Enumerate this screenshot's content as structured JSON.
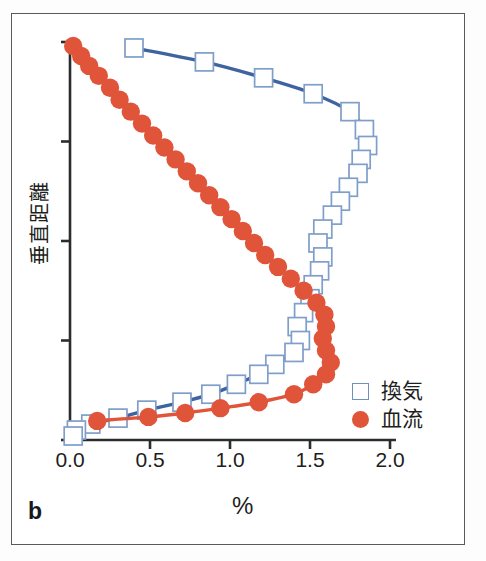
{
  "panel": {
    "label": "b"
  },
  "axes": {
    "x_title": "%",
    "y_title": "垂直距離",
    "x_ticks": [
      "0.0",
      "0.5",
      "1.0",
      "1.5",
      "2.0"
    ],
    "y_tick_count": 5
  },
  "legend": {
    "entries": [
      {
        "label": "換気",
        "marker": "open-square",
        "color": "#6f8fc0"
      },
      {
        "label": "血流",
        "marker": "filled-circle",
        "color": "#e0543a"
      }
    ]
  },
  "colors": {
    "ventilation_line": "#3f63a0",
    "ventilation_marker_edge": "#7f9ec9",
    "ventilation_marker_fill": "#ffffff",
    "perfusion": "#e0543a",
    "axis": "#2b2c2e",
    "frame": "#555b5e",
    "background": "#ffffff"
  },
  "chart_data": {
    "type": "line",
    "title": "",
    "xlabel": "%",
    "ylabel": "垂直距離",
    "xlim": [
      0.0,
      2.0
    ],
    "ylim": [
      0,
      100
    ],
    "grid": false,
    "legend_position": "bottom-right",
    "orientation": "horizontal-value-vertical-distance",
    "series": [
      {
        "name": "換気",
        "marker": "open-square",
        "color": "#3f63a0",
        "points": [
          {
            "x": 0.4,
            "y": 98.5
          },
          {
            "x": 0.84,
            "y": 95.0
          },
          {
            "x": 1.21,
            "y": 91.0
          },
          {
            "x": 1.52,
            "y": 87.0
          },
          {
            "x": 1.75,
            "y": 82.5
          },
          {
            "x": 1.84,
            "y": 78.0
          },
          {
            "x": 1.86,
            "y": 74.0
          },
          {
            "x": 1.82,
            "y": 70.5
          },
          {
            "x": 1.8,
            "y": 67.0
          },
          {
            "x": 1.74,
            "y": 63.5
          },
          {
            "x": 1.69,
            "y": 60.0
          },
          {
            "x": 1.64,
            "y": 56.5
          },
          {
            "x": 1.58,
            "y": 53.0
          },
          {
            "x": 1.55,
            "y": 49.5
          },
          {
            "x": 1.58,
            "y": 46.0
          },
          {
            "x": 1.56,
            "y": 42.5
          },
          {
            "x": 1.52,
            "y": 39.0
          },
          {
            "x": 1.5,
            "y": 35.5
          },
          {
            "x": 1.46,
            "y": 32.0
          },
          {
            "x": 1.42,
            "y": 28.5
          },
          {
            "x": 1.44,
            "y": 25.0
          },
          {
            "x": 1.4,
            "y": 22.0
          },
          {
            "x": 1.28,
            "y": 19.0
          },
          {
            "x": 1.18,
            "y": 16.5
          },
          {
            "x": 1.04,
            "y": 14.0
          },
          {
            "x": 0.88,
            "y": 11.5
          },
          {
            "x": 0.7,
            "y": 9.5
          },
          {
            "x": 0.48,
            "y": 7.5
          },
          {
            "x": 0.3,
            "y": 5.5
          },
          {
            "x": 0.13,
            "y": 4.0
          },
          {
            "x": 0.04,
            "y": 2.5
          },
          {
            "x": 0.02,
            "y": 1.0
          }
        ]
      },
      {
        "name": "血流",
        "marker": "filled-circle",
        "color": "#e0543a",
        "points": [
          {
            "x": 0.02,
            "y": 99.0
          },
          {
            "x": 0.07,
            "y": 96.5
          },
          {
            "x": 0.12,
            "y": 94.0
          },
          {
            "x": 0.18,
            "y": 91.5
          },
          {
            "x": 0.25,
            "y": 88.5
          },
          {
            "x": 0.31,
            "y": 85.5
          },
          {
            "x": 0.38,
            "y": 82.5
          },
          {
            "x": 0.45,
            "y": 79.5
          },
          {
            "x": 0.52,
            "y": 76.5
          },
          {
            "x": 0.59,
            "y": 73.5
          },
          {
            "x": 0.66,
            "y": 70.5
          },
          {
            "x": 0.73,
            "y": 67.5
          },
          {
            "x": 0.8,
            "y": 64.5
          },
          {
            "x": 0.87,
            "y": 61.5
          },
          {
            "x": 0.94,
            "y": 58.5
          },
          {
            "x": 1.01,
            "y": 55.5
          },
          {
            "x": 1.08,
            "y": 52.5
          },
          {
            "x": 1.15,
            "y": 49.5
          },
          {
            "x": 1.22,
            "y": 46.5
          },
          {
            "x": 1.3,
            "y": 43.5
          },
          {
            "x": 1.38,
            "y": 40.5
          },
          {
            "x": 1.46,
            "y": 37.5
          },
          {
            "x": 1.54,
            "y": 34.5
          },
          {
            "x": 1.59,
            "y": 31.5
          },
          {
            "x": 1.6,
            "y": 28.5
          },
          {
            "x": 1.58,
            "y": 25.5
          },
          {
            "x": 1.6,
            "y": 22.5
          },
          {
            "x": 1.63,
            "y": 19.5
          },
          {
            "x": 1.6,
            "y": 16.5
          },
          {
            "x": 1.52,
            "y": 14.0
          },
          {
            "x": 1.4,
            "y": 11.5
          },
          {
            "x": 1.18,
            "y": 9.5
          },
          {
            "x": 0.94,
            "y": 8.0
          },
          {
            "x": 0.72,
            "y": 6.8
          },
          {
            "x": 0.49,
            "y": 5.8
          },
          {
            "x": 0.17,
            "y": 4.8
          }
        ]
      }
    ]
  }
}
